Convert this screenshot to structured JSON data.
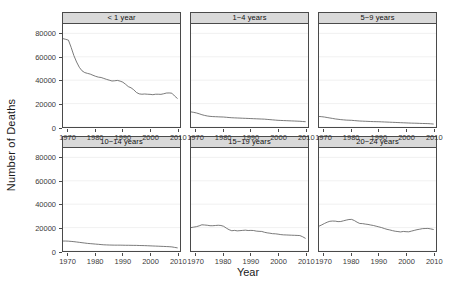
{
  "chart_data": {
    "type": "line",
    "title": "",
    "xlabel": "Year",
    "ylabel": "Number of Deaths",
    "xlim": [
      1968,
      2011
    ],
    "ylim": [
      0,
      88000
    ],
    "xticks": [
      1970,
      1980,
      1990,
      2000,
      2010
    ],
    "yticks": [
      0,
      20000,
      40000,
      60000,
      80000
    ],
    "ytick_labels": [
      "0",
      "20000",
      "40000",
      "60000",
      "80000"
    ],
    "xtick_labels": [
      "1970",
      "1980",
      "1990",
      "2000",
      "2010"
    ],
    "grid": true,
    "legend": "none",
    "facet_layout": "2 rows x 3 columns",
    "x": [
      1968,
      1969,
      1970,
      1971,
      1972,
      1973,
      1974,
      1975,
      1976,
      1977,
      1978,
      1979,
      1980,
      1981,
      1982,
      1983,
      1984,
      1985,
      1986,
      1987,
      1988,
      1989,
      1990,
      1991,
      1992,
      1993,
      1994,
      1995,
      1996,
      1997,
      1998,
      1999,
      2000,
      2001,
      2002,
      2003,
      2004,
      2005,
      2006,
      2007,
      2008,
      2009,
      2010
    ],
    "panels": [
      {
        "label": "< 1 year",
        "values": [
          75500,
          74900,
          74200,
          68000,
          61000,
          55500,
          51000,
          48000,
          46500,
          45800,
          45200,
          44200,
          43300,
          42600,
          42300,
          41500,
          40700,
          40000,
          39300,
          39500,
          39800,
          39200,
          38300,
          36500,
          34500,
          33500,
          31800,
          29500,
          28300,
          28000,
          28200,
          28000,
          27900,
          27600,
          28000,
          28000,
          27900,
          28400,
          29000,
          29100,
          28900,
          26500,
          24500
        ]
      },
      {
        "label": "1−4 years",
        "values": [
          12900,
          12500,
          12000,
          11300,
          10500,
          9900,
          9400,
          9100,
          8900,
          8800,
          8700,
          8600,
          8500,
          8300,
          8100,
          7900,
          7800,
          7700,
          7600,
          7500,
          7400,
          7300,
          7200,
          7100,
          7000,
          6900,
          6800,
          6700,
          6500,
          6300,
          6100,
          5900,
          5700,
          5600,
          5500,
          5400,
          5300,
          5200,
          5100,
          5000,
          4900,
          4700,
          4550
        ]
      },
      {
        "label": "5−9 years",
        "values": [
          9000,
          8800,
          8500,
          8100,
          7700,
          7300,
          6900,
          6600,
          6300,
          6100,
          5900,
          5800,
          5700,
          5500,
          5300,
          5100,
          5000,
          4900,
          4800,
          4700,
          4600,
          4550,
          4500,
          4400,
          4300,
          4200,
          4100,
          4000,
          3900,
          3800,
          3700,
          3600,
          3500,
          3400,
          3300,
          3250,
          3200,
          3100,
          3000,
          2950,
          2900,
          2750,
          2550
        ]
      },
      {
        "label": "10−14 years",
        "values": [
          8500,
          8500,
          8400,
          8200,
          8000,
          7700,
          7400,
          7100,
          6800,
          6500,
          6300,
          6100,
          5900,
          5700,
          5500,
          5300,
          5200,
          5100,
          5050,
          5000,
          5000,
          5000,
          4950,
          4900,
          4900,
          4850,
          4800,
          4800,
          4700,
          4650,
          4600,
          4500,
          4400,
          4300,
          4200,
          4100,
          4000,
          3900,
          3800,
          3700,
          3500,
          3100,
          2700
        ]
      },
      {
        "label": "15−19 years",
        "values": [
          20000,
          20400,
          20800,
          21500,
          22400,
          22200,
          22000,
          21600,
          21600,
          21800,
          22000,
          21800,
          21100,
          19500,
          18200,
          17300,
          17600,
          17200,
          17400,
          17600,
          17800,
          17500,
          17600,
          17500,
          17000,
          16800,
          16700,
          16000,
          15500,
          15200,
          14800,
          14700,
          14400,
          14000,
          13800,
          13700,
          13600,
          13500,
          13400,
          13300,
          13200,
          12200,
          10900
        ]
      },
      {
        "label": "20−24 years",
        "values": [
          21200,
          22300,
          23500,
          24600,
          25400,
          25600,
          25500,
          25100,
          25200,
          25800,
          26400,
          26900,
          27000,
          26000,
          24600,
          23500,
          23400,
          23000,
          22700,
          22200,
          21800,
          21200,
          20600,
          20000,
          19200,
          18500,
          18000,
          17400,
          16900,
          16600,
          16300,
          16700,
          16500,
          16400,
          17000,
          17600,
          18200,
          18600,
          19100,
          19200,
          19300,
          18900,
          18400
        ]
      }
    ]
  }
}
